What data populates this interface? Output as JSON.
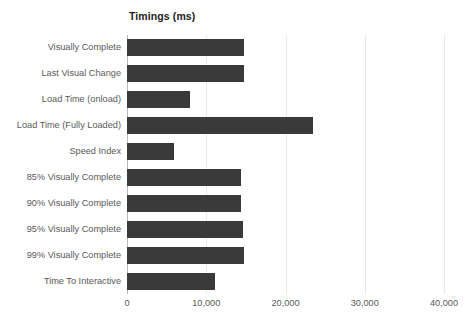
{
  "chart_data": {
    "type": "bar",
    "orientation": "horizontal",
    "title": "Timings (ms)",
    "xlabel": "",
    "ylabel": "",
    "xlim": [
      0,
      40000
    ],
    "grid": true,
    "legend": false,
    "bar_color": "#3a3a3a",
    "gridline_color": "#e8e8e8",
    "axis_color": "#b9b9b9",
    "label_color": "#595959",
    "categories": [
      "Visually Complete",
      "Last Visual Change",
      "Load Time (onload)",
      "Load Time (Fully Loaded)",
      "Speed Index",
      "85% Visually Complete",
      "90% Visually Complete",
      "95% Visually Complete",
      "99% Visually Complete",
      "Time To Interactive"
    ],
    "values": [
      14750,
      14750,
      7950,
      23500,
      5900,
      14400,
      14400,
      14700,
      14800,
      11100
    ],
    "xticks": [
      0,
      10000,
      20000,
      30000,
      40000
    ],
    "xtick_labels": [
      "0",
      "10,000",
      "20,000",
      "30,000",
      "40,000"
    ]
  }
}
